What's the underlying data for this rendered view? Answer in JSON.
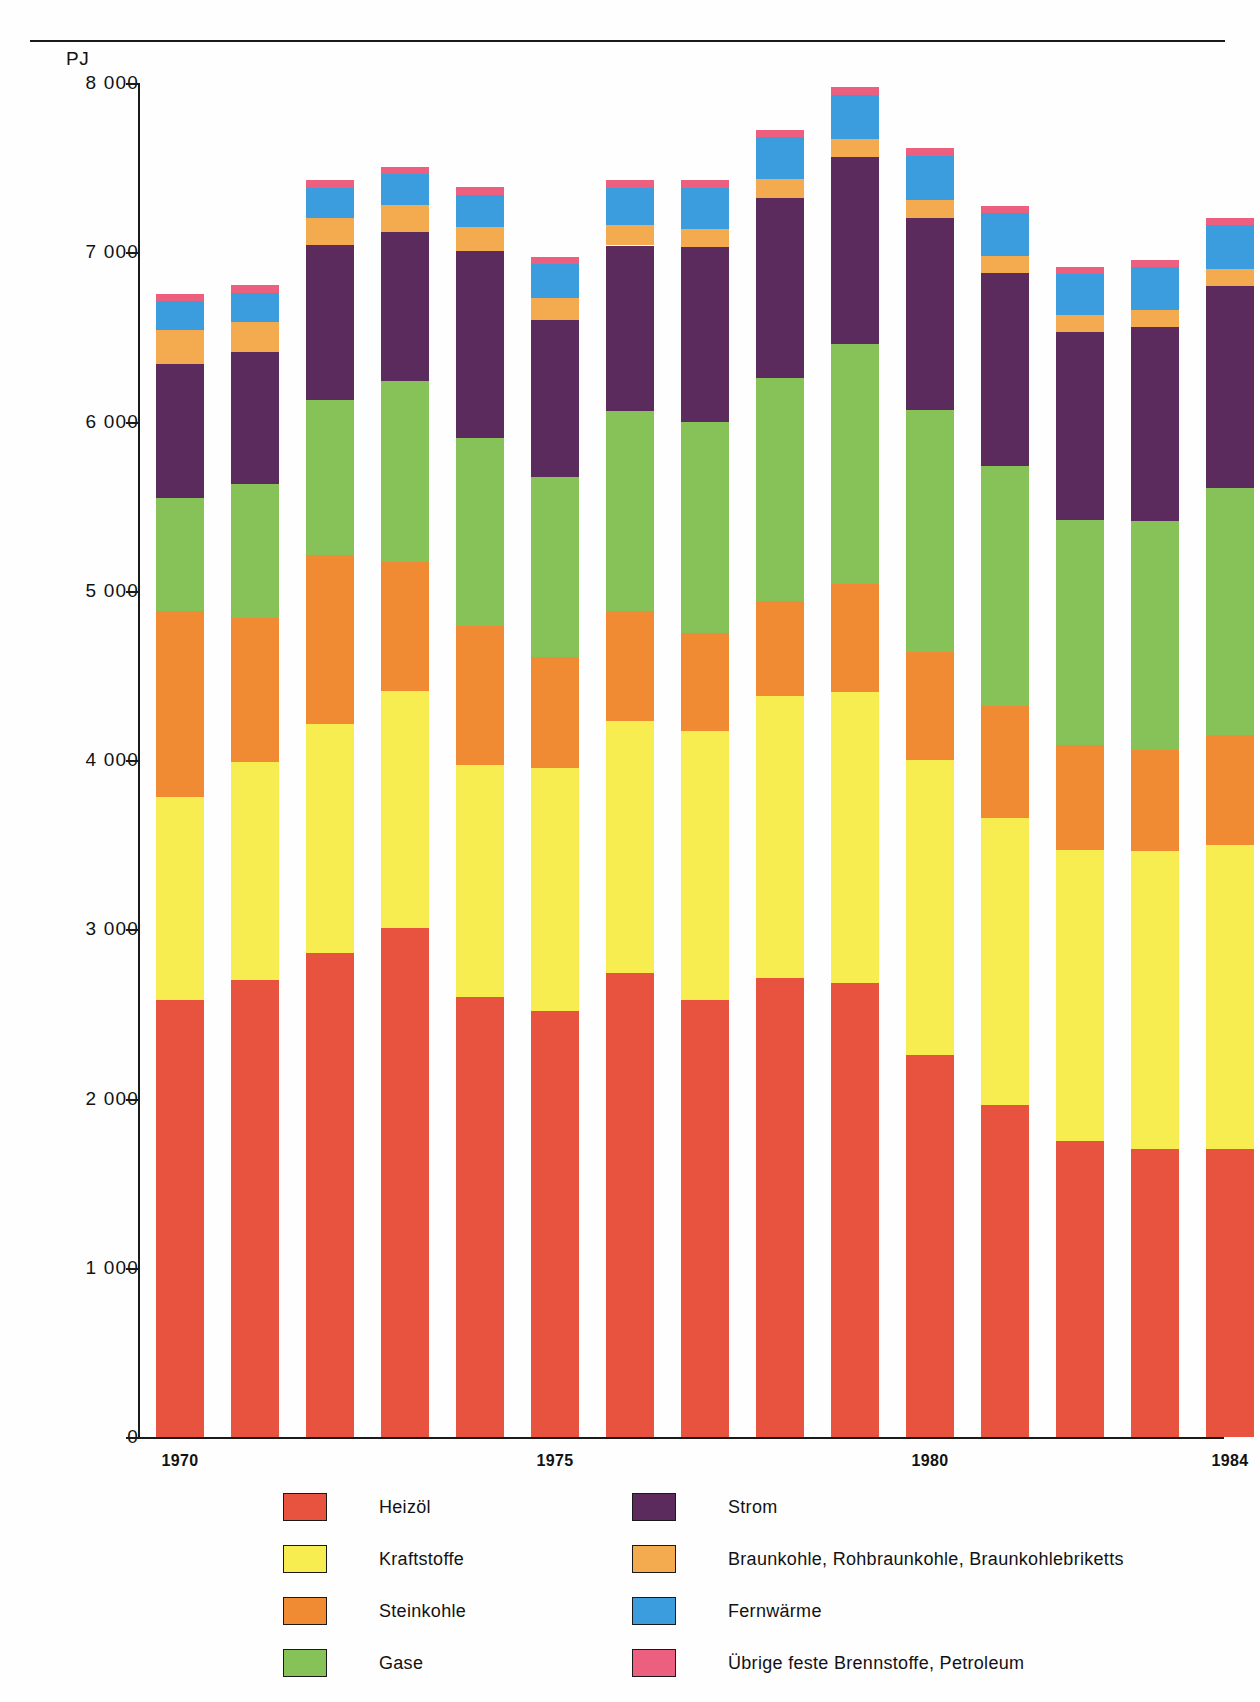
{
  "axis": {
    "unit_label": "PJ",
    "y_ticks": [
      "8 000",
      "7 000",
      "6 000",
      "5 000",
      "4 000",
      "3 000",
      "2 000",
      "1 000",
      "0"
    ],
    "y_tick_values": [
      8000,
      7000,
      6000,
      5000,
      4000,
      3000,
      2000,
      1000,
      0
    ],
    "x_tick_labels": [
      "1970",
      "1975",
      "1980",
      "1984"
    ],
    "x_tick_years": [
      1970,
      1975,
      1980,
      1984
    ]
  },
  "legend": {
    "left_column": [
      {
        "label": "Heizöl",
        "color": "#e8533f"
      },
      {
        "label": "Kraftstoffe",
        "color": "#f7ec50"
      },
      {
        "label": "Steinkohle",
        "color": "#f08a33"
      },
      {
        "label": "Gase",
        "color": "#86c257"
      }
    ],
    "right_column": [
      {
        "label": "Strom",
        "color": "#5b2b5e"
      },
      {
        "label": "Braunkohle, Rohbraunkohle, Braunkohlebriketts",
        "color": "#f4ab4f"
      },
      {
        "label": "Fernwärme",
        "color": "#3b9ddd"
      },
      {
        "label": "Übrige feste Brennstoffe, Petroleum",
        "color": "#ec5f7e"
      }
    ]
  },
  "chart_data": {
    "type": "bar",
    "stacked": true,
    "title": "",
    "xlabel": "",
    "ylabel": "PJ",
    "ylim": [
      0,
      8000
    ],
    "grid": false,
    "legend_position": "bottom",
    "categories": [
      "1970",
      "1971",
      "1972",
      "1973",
      "1974",
      "1975",
      "1976",
      "1977",
      "1978",
      "1979",
      "1980",
      "1981",
      "1982",
      "1983",
      "1984"
    ],
    "series": [
      {
        "name": "Heizöl",
        "color": "#e8533f",
        "values": [
          2580,
          2700,
          2860,
          3010,
          2600,
          2520,
          2740,
          2580,
          2710,
          2680,
          2260,
          1960,
          1750,
          1700,
          1700
        ]
      },
      {
        "name": "Kraftstoffe",
        "color": "#f7ec50",
        "values": [
          1200,
          1290,
          1350,
          1400,
          1370,
          1430,
          1490,
          1590,
          1670,
          1720,
          1740,
          1700,
          1720,
          1760,
          1800
        ]
      },
      {
        "name": "Steinkohle",
        "color": "#f08a33",
        "values": [
          1100,
          850,
          1000,
          760,
          820,
          660,
          650,
          580,
          560,
          640,
          640,
          660,
          620,
          600,
          650
        ]
      },
      {
        "name": "Gase",
        "color": "#86c257",
        "values": [
          670,
          790,
          920,
          1070,
          1110,
          1060,
          1180,
          1250,
          1320,
          1420,
          1430,
          1420,
          1330,
          1350,
          1460
        ]
      },
      {
        "name": "Strom",
        "color": "#5b2b5e",
        "values": [
          790,
          780,
          910,
          880,
          1110,
          930,
          980,
          1030,
          1060,
          1100,
          1130,
          1140,
          1110,
          1150,
          1190
        ]
      },
      {
        "name": "Braunkohle, Rohbraunkohle, Braunkohlebriketts",
        "color": "#f4ab4f",
        "values": [
          200,
          180,
          160,
          160,
          140,
          130,
          120,
          110,
          110,
          110,
          110,
          100,
          100,
          100,
          100
        ]
      },
      {
        "name": "Fernwärme",
        "color": "#3b9ddd",
        "values": [
          170,
          170,
          180,
          180,
          190,
          200,
          220,
          240,
          250,
          260,
          260,
          250,
          240,
          250,
          260
        ]
      },
      {
        "name": "Übrige feste Brennstoffe, Petroleum",
        "color": "#ec5f7e",
        "values": [
          45,
          45,
          45,
          45,
          45,
          45,
          45,
          45,
          45,
          45,
          45,
          45,
          45,
          45,
          45
        ]
      }
    ],
    "totals": [
      6755,
      6805,
      7425,
      7505,
      7375,
      6975,
      7425,
      7425,
      7725,
      7975,
      7615,
      7275,
      6915,
      6955,
      7205
    ]
  },
  "geometry": {
    "plot_left": 138,
    "plot_bottom_y": 1437,
    "px_per_1000": 169.25,
    "bar_width": 48,
    "bar_pitch": 75,
    "first_bar_left": 156
  }
}
